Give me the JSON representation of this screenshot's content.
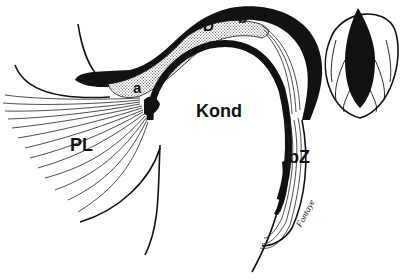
{
  "diagram": {
    "colors": {
      "ink": "#111111",
      "disc_fill": "#d6d6d6",
      "background": "#ffffff"
    },
    "labels": [
      {
        "id": "D",
        "text": "D",
        "x": 203,
        "y": 20,
        "size": 15
      },
      {
        "id": "b",
        "text": "b",
        "x": 238,
        "y": 12,
        "size": 15
      },
      {
        "id": "a",
        "text": "a",
        "x": 132,
        "y": 80,
        "size": 15
      },
      {
        "id": "Kond",
        "text": "Kond",
        "x": 196,
        "y": 102,
        "size": 18
      },
      {
        "id": "PL",
        "text": "PL",
        "x": 70,
        "y": 135,
        "size": 18
      },
      {
        "id": "bZ",
        "text": "bZ",
        "x": 288,
        "y": 147,
        "size": 18
      }
    ],
    "signature": "Fontaye",
    "figure_marker": "10"
  }
}
